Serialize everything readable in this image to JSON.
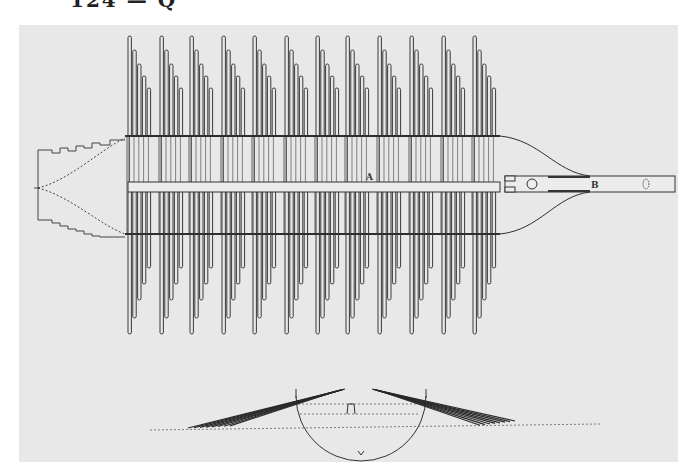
{
  "page": {
    "header_fragment": "124 — Q",
    "plate_color": "#e8e8e8",
    "ink_color": "#3a3a3a"
  },
  "figure": {
    "type": "engraved technical plate",
    "labels": [
      {
        "id": "A",
        "text": "A",
        "x": 370,
        "y": 178
      },
      {
        "id": "B",
        "text": "B",
        "x": 594,
        "y": 185
      }
    ],
    "tine_groups": {
      "count": 12,
      "x_starts": [
        128,
        160,
        190,
        222,
        253,
        285,
        316,
        346,
        378,
        410,
        442,
        473
      ],
      "tines_per_group": 5,
      "top_rail_y": 136,
      "bottom_rail_y": 234,
      "top_tine_tops": [
        36,
        50,
        64,
        76,
        88
      ],
      "bottom_tine_bottoms": [
        334,
        318,
        300,
        284,
        268
      ]
    },
    "central_bar": {
      "x1": 128,
      "x2": 500,
      "y_top": 182,
      "y_bottom": 192
    },
    "handle": {
      "x1": 505,
      "x2": 674,
      "y_top": 176,
      "y_bottom": 192
    },
    "left_structure": "crenellated end piece",
    "bottom_view": "semicircular side elevation with fanned tines"
  }
}
